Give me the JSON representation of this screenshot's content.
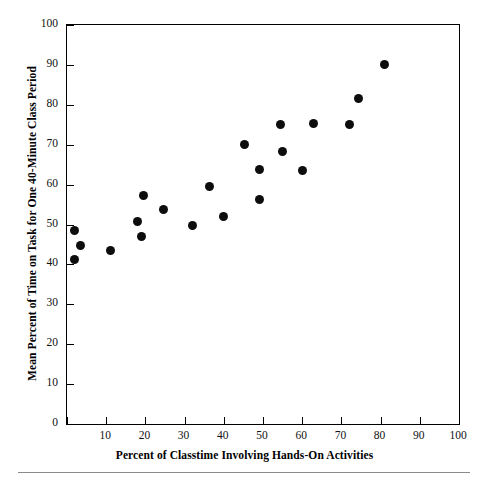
{
  "chart_data": {
    "type": "scatter",
    "title": "",
    "xlabel": "Percent of Classtime Involving Hands-On Activities",
    "ylabel": "Mean Percent of Time on Task for One 40-Minute Class Period",
    "xlim": [
      0,
      100
    ],
    "ylim": [
      0,
      100
    ],
    "xticks": [
      0,
      10,
      20,
      30,
      40,
      50,
      60,
      70,
      80,
      90,
      100
    ],
    "xtick_labels": [
      "",
      "10",
      "20",
      "30",
      "40",
      "50",
      "60",
      "70",
      "80",
      "90",
      "100"
    ],
    "yticks": [
      0,
      10,
      20,
      30,
      40,
      50,
      60,
      70,
      80,
      90,
      100
    ],
    "ytick_labels": [
      "0",
      "10",
      "20",
      "30",
      "40",
      "50",
      "60",
      "70",
      "80",
      "90",
      "100"
    ],
    "grid": false,
    "legend": null,
    "marker": {
      "shape": "circle",
      "color": "#0d0d0d",
      "size_px": 9
    },
    "n_points": 22,
    "points": [
      {
        "x": 2.0,
        "y": 48.5
      },
      {
        "x": 3.5,
        "y": 44.7
      },
      {
        "x": 2.0,
        "y": 41.3
      },
      {
        "x": 11.0,
        "y": 43.4
      },
      {
        "x": 18.0,
        "y": 50.7
      },
      {
        "x": 19.5,
        "y": 57.3
      },
      {
        "x": 19.0,
        "y": 47.0
      },
      {
        "x": 24.5,
        "y": 53.7
      },
      {
        "x": 32.0,
        "y": 49.8
      },
      {
        "x": 36.3,
        "y": 59.5
      },
      {
        "x": 40.0,
        "y": 51.9
      },
      {
        "x": 45.3,
        "y": 70.1
      },
      {
        "x": 49.0,
        "y": 63.9
      },
      {
        "x": 49.0,
        "y": 56.2
      },
      {
        "x": 54.5,
        "y": 75.1
      },
      {
        "x": 55.0,
        "y": 68.3
      },
      {
        "x": 60.0,
        "y": 63.6
      },
      {
        "x": 62.8,
        "y": 75.4
      },
      {
        "x": 72.0,
        "y": 75.1
      },
      {
        "x": 74.3,
        "y": 81.6
      },
      {
        "x": 81.0,
        "y": 90.1
      }
    ]
  },
  "figure": {
    "background_color": "#ffffff",
    "axis_color": "#000000",
    "text_color": "#111111",
    "footer_rule_color": "#8a8a8a"
  }
}
